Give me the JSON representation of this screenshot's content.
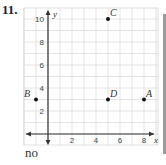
{
  "problem": {
    "number": "11.",
    "answer": "no"
  },
  "chart_data": {
    "type": "scatter",
    "title": "",
    "xlabel": "x",
    "ylabel": "y",
    "xlim": [
      -2,
      9
    ],
    "ylim": [
      -1,
      11
    ],
    "grid": true,
    "x_ticks": [
      "2",
      "4",
      "6",
      "8"
    ],
    "y_ticks": [
      "2",
      "4",
      "6",
      "8",
      "10"
    ],
    "points": [
      {
        "label": "A",
        "x": 8,
        "y": 3
      },
      {
        "label": "B",
        "x": -1,
        "y": 3
      },
      {
        "label": "C",
        "x": 5,
        "y": 10
      },
      {
        "label": "D",
        "x": 5,
        "y": 3
      }
    ]
  }
}
